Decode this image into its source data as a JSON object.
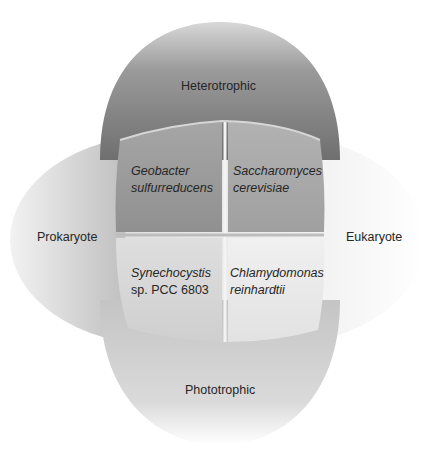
{
  "diagram": {
    "type": "venn-quadrant",
    "axes": {
      "top": "Heterotrophic",
      "bottom": "Phototrophic",
      "left": "Prokaryote",
      "right": "Eukaryote"
    },
    "quadrants": {
      "top_left": {
        "genus": "Geobacter",
        "species": "sulfurreducens",
        "strain": ""
      },
      "top_right": {
        "genus": "Saccharomyces",
        "species": "cerevisiae",
        "strain": ""
      },
      "bottom_left": {
        "genus": "Synechocystis",
        "species": "",
        "strain": "sp. PCC 6803"
      },
      "bottom_right": {
        "genus": "Chlamydomonas",
        "species": "reinhardtii",
        "strain": ""
      }
    },
    "colors": {
      "heterotrophic_top": "#7a7a7a",
      "phototrophic_bottom": "#cfcfcf",
      "prokaryote_left": "#a8a8a8",
      "eukaryote_right": "#ececec",
      "q_top_left": "#9a9a9a",
      "q_top_right": "#a9a9a9",
      "q_bottom_left": "#d6d6d6",
      "q_bottom_right": "#e6e6e6"
    }
  }
}
